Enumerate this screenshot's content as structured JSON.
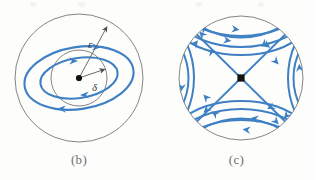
{
  "figure": {
    "background_color": "#fdfdfb",
    "curve_color": "#3f80c4",
    "circle_color": "#6f6f6f",
    "point_color": "#111111",
    "label_color": "#4a4a4a"
  },
  "panels": [
    {
      "id": "b",
      "caption": "(b)",
      "kind": "center-stable-orbits",
      "center": {
        "x": 79,
        "y": 78
      },
      "circles": [
        {
          "name": "epsilon-circle",
          "radius": 64,
          "label": "ε"
        },
        {
          "name": "delta-circle",
          "radius": 28,
          "label": "δ"
        }
      ],
      "radius_labels": [
        {
          "name": "epsilon-label",
          "text": "ε",
          "x": 89,
          "y": 45
        },
        {
          "name": "delta-label",
          "text": "δ",
          "x": 95,
          "y": 87
        }
      ],
      "orbits": [
        {
          "name": "inner-orbit",
          "rx": 38,
          "ry": 19,
          "direction": "clockwise"
        },
        {
          "name": "outer-orbit",
          "rx": 54,
          "ry": 30,
          "direction": "clockwise"
        }
      ],
      "equilibrium": {
        "name": "center-point",
        "type": "center",
        "x": 79,
        "y": 78
      }
    },
    {
      "id": "c",
      "caption": "(c)",
      "kind": "saddle-streamlines",
      "center": {
        "x": 83,
        "y": 78
      },
      "circles": [
        {
          "name": "boundary-circle",
          "radius": 62,
          "label": ""
        }
      ],
      "radius_labels": [],
      "orbits": [],
      "equilibrium": {
        "name": "saddle-point",
        "type": "saddle",
        "x": 83,
        "y": 78
      }
    }
  ]
}
